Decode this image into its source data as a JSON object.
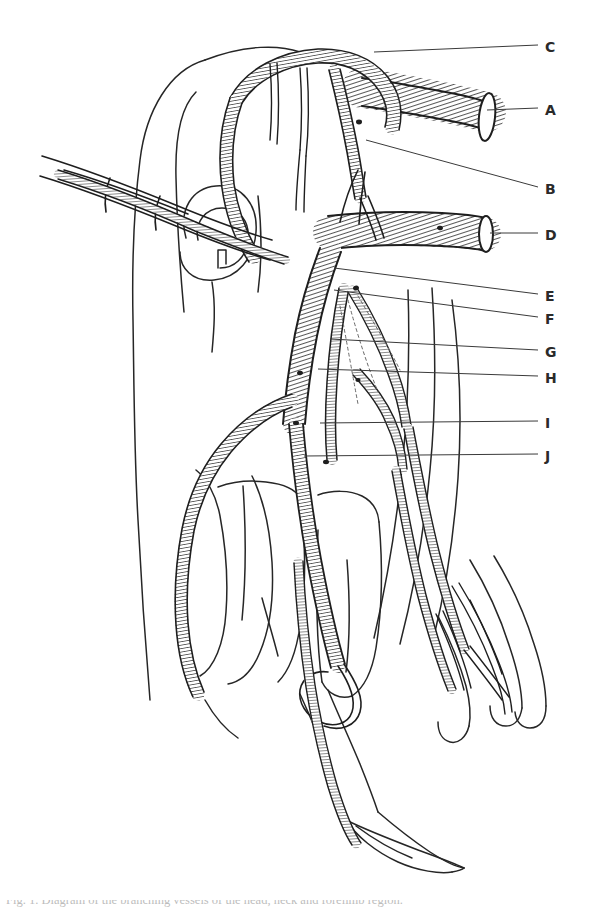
{
  "figure": {
    "kind": "anatomical-line-drawing",
    "background_color": "#ffffff",
    "ink_color": "#1e1e1e",
    "leader_line_color": "#3a3a3a",
    "width": 598,
    "height": 912
  },
  "labels": [
    {
      "id": "C",
      "text": "C",
      "x": 545,
      "y": 40,
      "leader": {
        "x1": 374,
        "y1": 52,
        "x2": 538,
        "y2": 45
      }
    },
    {
      "id": "A",
      "text": "A",
      "x": 545,
      "y": 103,
      "leader": {
        "x1": 487,
        "y1": 110,
        "x2": 538,
        "y2": 108
      }
    },
    {
      "id": "B",
      "text": "B",
      "x": 545,
      "y": 182,
      "leader": {
        "x1": 366,
        "y1": 140,
        "x2": 538,
        "y2": 187
      }
    },
    {
      "id": "D",
      "text": "D",
      "x": 545,
      "y": 228,
      "leader": {
        "x1": 490,
        "y1": 233,
        "x2": 538,
        "y2": 233
      }
    },
    {
      "id": "E",
      "text": "E",
      "x": 545,
      "y": 289,
      "leader": {
        "x1": 334,
        "y1": 268,
        "x2": 538,
        "y2": 294
      }
    },
    {
      "id": "F",
      "text": "F",
      "x": 545,
      "y": 312,
      "leader": {
        "x1": 334,
        "y1": 290,
        "x2": 538,
        "y2": 317
      }
    },
    {
      "id": "G",
      "text": "G",
      "x": 545,
      "y": 345,
      "leader": {
        "x1": 330,
        "y1": 339,
        "x2": 538,
        "y2": 350
      }
    },
    {
      "id": "H",
      "text": "H",
      "x": 545,
      "y": 371,
      "leader": {
        "x1": 318,
        "y1": 369,
        "x2": 538,
        "y2": 376
      }
    },
    {
      "id": "I",
      "text": "I",
      "x": 545,
      "y": 416,
      "leader": {
        "x1": 320,
        "y1": 423,
        "x2": 538,
        "y2": 421
      }
    },
    {
      "id": "J",
      "text": "J",
      "x": 545,
      "y": 449,
      "leader": {
        "x1": 304,
        "y1": 456,
        "x2": 538,
        "y2": 454
      }
    }
  ],
  "caption": {
    "text": "Fig. 1. Diagram of the branching vessels of the head, neck and forelimb region."
  }
}
